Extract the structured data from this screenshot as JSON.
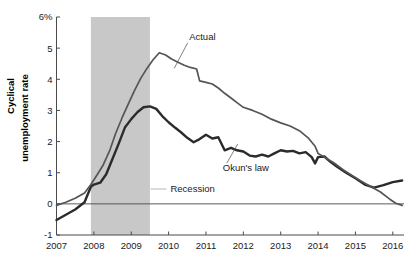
{
  "chart_data": {
    "type": "line",
    "title": "",
    "xlabel": "",
    "ylabel": "Cyclical unemployment rate",
    "ylabel_line1": "Cyclical",
    "ylabel_line2": "unemployment rate",
    "xlim": [
      2007.0,
      2016.3
    ],
    "ylim": [
      -1,
      6
    ],
    "grid": false,
    "y_ticks": [
      -1,
      0,
      1,
      2,
      3,
      4,
      5,
      6
    ],
    "y_tick_labels": [
      "-1",
      "0",
      "1",
      "2",
      "3",
      "4",
      "5",
      "6%"
    ],
    "x_ticks": [
      2007,
      2008,
      2009,
      2010,
      2011,
      2012,
      2013,
      2014,
      2015,
      2016
    ],
    "x_tick_labels": [
      "2007",
      "2008",
      "2009",
      "2010",
      "2011",
      "2012",
      "2013",
      "2014",
      "2015",
      "2016"
    ],
    "legend_position": "inline-annotations",
    "annotations": [
      {
        "text": "Actual",
        "x": 2010.55,
        "y": 5.25,
        "leader_to_x": 2010.15,
        "leader_to_y": 4.35
      },
      {
        "text": "Okun's law",
        "x": 2011.45,
        "y": 1.05,
        "leader_to_x": 2011.85,
        "leader_to_y": 1.92
      },
      {
        "text": "Recession",
        "x": 2010.05,
        "y": 0.38,
        "swatch": true
      }
    ],
    "shaded_regions": [
      {
        "label": "Recession",
        "x_start": 2007.92,
        "x_end": 2009.5,
        "color": "#c8c8c8"
      }
    ],
    "series": [
      {
        "name": "Actual",
        "color": "#555555",
        "width": 1.7,
        "x": [
          2007.0,
          2007.25,
          2007.5,
          2007.75,
          2007.92,
          2008.08,
          2008.25,
          2008.42,
          2008.58,
          2008.75,
          2008.92,
          2009.08,
          2009.25,
          2009.42,
          2009.58,
          2009.75,
          2009.92,
          2010.08,
          2010.25,
          2010.42,
          2010.58,
          2010.75,
          2010.83,
          2011.0,
          2011.17,
          2011.33,
          2011.5,
          2011.67,
          2011.83,
          2012.0,
          2012.25,
          2012.5,
          2012.75,
          2013.0,
          2013.25,
          2013.5,
          2013.75,
          2013.92,
          2014.0,
          2014.17,
          2014.42,
          2014.67,
          2014.92,
          2015.17,
          2015.42,
          2015.67,
          2015.92,
          2016.08,
          2016.25
        ],
        "y": [
          -0.05,
          0.05,
          0.18,
          0.35,
          0.62,
          0.92,
          1.25,
          1.7,
          2.25,
          2.75,
          3.2,
          3.62,
          4.02,
          4.35,
          4.62,
          4.85,
          4.78,
          4.65,
          4.55,
          4.45,
          4.38,
          4.33,
          3.95,
          3.9,
          3.85,
          3.72,
          3.55,
          3.4,
          3.25,
          3.1,
          3.0,
          2.88,
          2.72,
          2.6,
          2.5,
          2.35,
          2.1,
          1.85,
          1.62,
          1.5,
          1.32,
          1.1,
          0.9,
          0.72,
          0.55,
          0.38,
          0.15,
          0.02,
          -0.05
        ]
      },
      {
        "name": "Okun's law",
        "color": "#2b2b2b",
        "width": 2.4,
        "x": [
          2007.0,
          2007.25,
          2007.5,
          2007.75,
          2007.92,
          2008.0,
          2008.17,
          2008.33,
          2008.5,
          2008.67,
          2008.83,
          2009.0,
          2009.17,
          2009.33,
          2009.5,
          2009.67,
          2009.83,
          2010.0,
          2010.17,
          2010.33,
          2010.5,
          2010.67,
          2010.83,
          2011.0,
          2011.17,
          2011.33,
          2011.5,
          2011.67,
          2011.83,
          2012.0,
          2012.17,
          2012.33,
          2012.5,
          2012.67,
          2012.83,
          2013.0,
          2013.17,
          2013.33,
          2013.5,
          2013.67,
          2013.83,
          2013.92,
          2014.0,
          2014.17,
          2014.33,
          2014.5,
          2014.75,
          2015.0,
          2015.25,
          2015.5,
          2015.75,
          2016.0,
          2016.25
        ],
        "y": [
          -0.52,
          -0.35,
          -0.18,
          0.05,
          0.55,
          0.62,
          0.68,
          0.95,
          1.45,
          1.95,
          2.45,
          2.72,
          2.95,
          3.1,
          3.13,
          3.05,
          2.82,
          2.62,
          2.45,
          2.3,
          2.12,
          1.98,
          2.08,
          2.22,
          2.1,
          2.14,
          1.72,
          1.8,
          1.72,
          1.68,
          1.55,
          1.52,
          1.58,
          1.52,
          1.62,
          1.72,
          1.68,
          1.7,
          1.62,
          1.66,
          1.5,
          1.3,
          1.5,
          1.52,
          1.35,
          1.2,
          1.0,
          0.82,
          0.62,
          0.52,
          0.6,
          0.7,
          0.75
        ]
      }
    ]
  },
  "figure": {
    "background": "#ffffff",
    "axis_color": "#4a4a4a",
    "recession_band_color": "#c8c8c8",
    "actual_color": "#555555",
    "okun_color": "#2b2b2b"
  }
}
